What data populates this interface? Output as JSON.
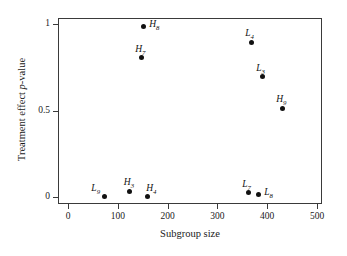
{
  "chart_data": {
    "type": "scatter",
    "title": "",
    "xlabel": "Subgroup size",
    "ylabel_parts": {
      "pre": "Treatment effect ",
      "italic": "p",
      "post": "-value"
    },
    "ylabel": "Treatment effect p-value",
    "xlim": [
      0,
      510
    ],
    "ylim": [
      -0.02,
      1.03
    ],
    "xticks": [
      0,
      100,
      200,
      300,
      400,
      500
    ],
    "xtick_labels": [
      "0",
      "100",
      "200",
      "300",
      "400",
      "500"
    ],
    "yticks": [
      0,
      0.5,
      1
    ],
    "ytick_labels": [
      "0",
      "0.5",
      "1"
    ],
    "grid": false,
    "legend": "none",
    "marker": "filled-circle",
    "marker_color": "#111111",
    "points": [
      {
        "label_base": "H",
        "label_sub": "8",
        "x": 149,
        "y": 0.99,
        "label_pos": "right"
      },
      {
        "label_base": "H",
        "label_sub": "7",
        "x": 145,
        "y": 0.81,
        "label_pos": "above"
      },
      {
        "label_base": "L",
        "label_sub": "4",
        "x": 366,
        "y": 0.9,
        "label_pos": "above"
      },
      {
        "label_base": "L",
        "label_sub": "3",
        "x": 388,
        "y": 0.7,
        "label_pos": "above"
      },
      {
        "label_base": "H",
        "label_sub": "9",
        "x": 428,
        "y": 0.52,
        "label_pos": "above"
      },
      {
        "label_base": "L",
        "label_sub": "9",
        "x": 71,
        "y": 0.01,
        "label_pos": "above-left"
      },
      {
        "label_base": "H",
        "label_sub": "3",
        "x": 122,
        "y": 0.04,
        "label_pos": "above"
      },
      {
        "label_base": "H",
        "label_sub": "4",
        "x": 157,
        "y": 0.01,
        "label_pos": "above-right"
      },
      {
        "label_base": "L",
        "label_sub": "7",
        "x": 360,
        "y": 0.03,
        "label_pos": "above"
      },
      {
        "label_base": "L",
        "label_sub": "8",
        "x": 380,
        "y": 0.02,
        "label_pos": "right"
      }
    ]
  }
}
